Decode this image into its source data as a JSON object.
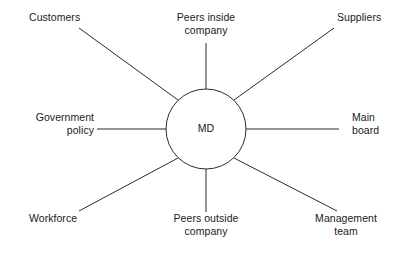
{
  "diagram": {
    "type": "spider-diagram",
    "hub": {
      "label": "MD",
      "center_x": 206,
      "center_y": 129,
      "radius": 40
    },
    "nodes": [
      {
        "id": "customers",
        "label": "Customers",
        "position": "top-left",
        "spoke": {
          "x1": 178,
          "y1": 100,
          "x2": 79,
          "y2": 28
        }
      },
      {
        "id": "peers-inside-company",
        "label": "Peers inside\ncompany",
        "position": "top-center",
        "spoke": {
          "x1": 206,
          "y1": 89,
          "x2": 206,
          "y2": 43
        }
      },
      {
        "id": "suppliers",
        "label": "Suppliers",
        "position": "top-right",
        "spoke": {
          "x1": 234,
          "y1": 100,
          "x2": 334,
          "y2": 28
        }
      },
      {
        "id": "government-policy",
        "label": "Government\npolicy",
        "position": "left",
        "spoke": {
          "x1": 166,
          "y1": 129,
          "x2": 97,
          "y2": 129
        }
      },
      {
        "id": "main-board",
        "label": "Main\nboard",
        "position": "right",
        "spoke": {
          "x1": 246,
          "y1": 129,
          "x2": 339,
          "y2": 129
        }
      },
      {
        "id": "workforce",
        "label": "Workforce",
        "position": "bottom-left",
        "spoke": {
          "x1": 178,
          "y1": 158,
          "x2": 79,
          "y2": 211
        }
      },
      {
        "id": "peers-outside-company",
        "label": "Peers outside\ncompany",
        "position": "bottom-center",
        "spoke": {
          "x1": 206,
          "y1": 169,
          "x2": 206,
          "y2": 212
        }
      },
      {
        "id": "management-team",
        "label": "Management\nteam",
        "position": "bottom-right",
        "spoke": {
          "x1": 234,
          "y1": 158,
          "x2": 337,
          "y2": 211
        }
      }
    ],
    "colors": {
      "background": "#ffffff",
      "stroke": "#2b2b2b",
      "text": "#1a1a1a"
    }
  }
}
